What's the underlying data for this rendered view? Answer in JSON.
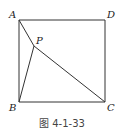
{
  "figure": {
    "caption": "图 4-1-33",
    "points": {
      "A": {
        "label": "A",
        "x": 19,
        "y": 20
      },
      "D": {
        "label": "D",
        "x": 105,
        "y": 20
      },
      "B": {
        "label": "B",
        "x": 19,
        "y": 102
      },
      "C": {
        "label": "C",
        "x": 105,
        "y": 102
      },
      "P": {
        "label": "P",
        "x": 34,
        "y": 46
      }
    },
    "segments": [
      "AD",
      "DC",
      "CB",
      "BA",
      "AP",
      "BP",
      "PC"
    ],
    "stroke_color": "#333333"
  }
}
